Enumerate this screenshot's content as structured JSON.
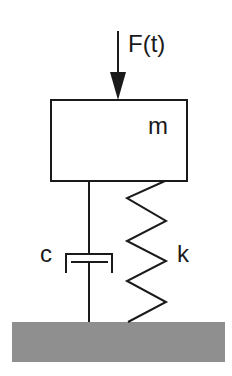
{
  "diagram": {
    "labels": {
      "force": "F(t)",
      "mass": "m",
      "damper": "c",
      "spring": "k"
    },
    "colors": {
      "line": "#1a1a1a",
      "ground": "#8f8f8f",
      "background": "#ffffff"
    }
  }
}
